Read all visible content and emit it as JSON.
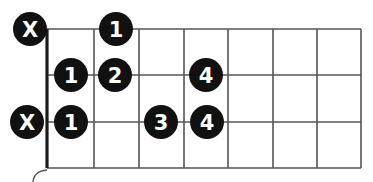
{
  "diagram": {
    "type": "chord-chart",
    "colors": {
      "background": "#ffffff",
      "grid": "#555555",
      "nut": "#1a1a1a",
      "dot": "#111111",
      "dot_text": "#ffffff"
    },
    "geometry": {
      "nut_x": 47,
      "fret_x": [
        94,
        139,
        184,
        228,
        273,
        317,
        361
      ],
      "string_y": [
        29,
        75,
        122,
        168
      ],
      "top_y": 29,
      "bottom_y": 168,
      "dot_radius": 17
    },
    "markers": [
      {
        "row": 0,
        "x": 30,
        "label": "X",
        "kind": "muted"
      },
      {
        "row": 0,
        "x": 116,
        "label": "1",
        "kind": "finger"
      },
      {
        "row": 1,
        "x": 71,
        "label": "1",
        "kind": "finger"
      },
      {
        "row": 1,
        "x": 115,
        "label": "2",
        "kind": "finger"
      },
      {
        "row": 1,
        "x": 206,
        "label": "4",
        "kind": "finger"
      },
      {
        "row": 2,
        "x": 27,
        "label": "X",
        "kind": "muted"
      },
      {
        "row": 2,
        "x": 71,
        "label": "1",
        "kind": "finger"
      },
      {
        "row": 2,
        "x": 161,
        "label": "3",
        "kind": "finger"
      },
      {
        "row": 2,
        "x": 207,
        "label": "4",
        "kind": "finger"
      }
    ]
  }
}
